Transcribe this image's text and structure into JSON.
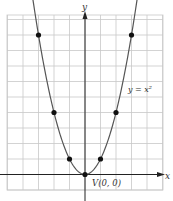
{
  "chart_data": {
    "type": "line",
    "title": "",
    "function_label": "y = x²",
    "xlabel": "x",
    "ylabel": "y",
    "vertex_label": "V(0, 0)",
    "xlim": [
      -5,
      5
    ],
    "ylim": [
      -1,
      10
    ],
    "grid": true,
    "series": [
      {
        "name": "y = x^2",
        "points": [
          {
            "x": -3,
            "y": 9
          },
          {
            "x": -2,
            "y": 4
          },
          {
            "x": -1,
            "y": 1
          },
          {
            "x": 0,
            "y": 0
          },
          {
            "x": 1,
            "y": 1
          },
          {
            "x": 2,
            "y": 4
          },
          {
            "x": 3,
            "y": 9
          }
        ]
      }
    ]
  },
  "colors": {
    "grid": "#c8c8c8",
    "axis": "#222222",
    "curve": "#555555",
    "point": "#111111"
  }
}
